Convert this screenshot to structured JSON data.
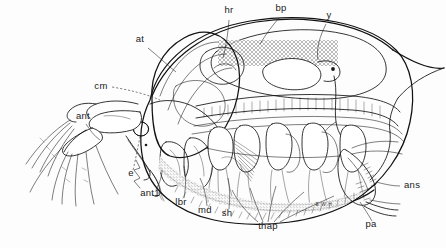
{
  "figure": {
    "organism": "Daphnia",
    "view": "lateral",
    "style": "pen-and-ink stipple line drawing",
    "background_color": "#fdfdfd",
    "ink_color": "#121212",
    "signature": "E.W.H."
  },
  "labels": [
    {
      "id": "at",
      "text": "at",
      "x": 140,
      "y": 42,
      "anchor": "middle"
    },
    {
      "id": "hr",
      "text": "hr",
      "x": 229,
      "y": 13,
      "anchor": "middle"
    },
    {
      "id": "bp",
      "text": "bp",
      "x": 281,
      "y": 11,
      "anchor": "middle"
    },
    {
      "id": "y",
      "text": "y",
      "x": 329,
      "y": 18,
      "anchor": "middle"
    },
    {
      "id": "cm",
      "text": "cm",
      "x": 101,
      "y": 89,
      "anchor": "middle"
    },
    {
      "id": "ant",
      "text": "ant",
      "x": 83,
      "y": 119,
      "anchor": "middle"
    },
    {
      "id": "e",
      "text": "e",
      "x": 131,
      "y": 176,
      "anchor": "middle"
    },
    {
      "id": "ant1",
      "text": "ant1",
      "x": 150,
      "y": 196,
      "anchor": "middle"
    },
    {
      "id": "lbr",
      "text": "lbr",
      "x": 181,
      "y": 205,
      "anchor": "middle"
    },
    {
      "id": "md",
      "text": "md",
      "x": 205,
      "y": 213,
      "anchor": "middle"
    },
    {
      "id": "sh",
      "text": "sh",
      "x": 227,
      "y": 216,
      "anchor": "middle"
    },
    {
      "id": "thap",
      "text": "thap",
      "x": 268,
      "y": 229,
      "anchor": "middle"
    },
    {
      "id": "ans",
      "text": "ans",
      "x": 404,
      "y": 188,
      "anchor": "start"
    },
    {
      "id": "pa",
      "text": "pa",
      "x": 371,
      "y": 227,
      "anchor": "middle"
    }
  ]
}
